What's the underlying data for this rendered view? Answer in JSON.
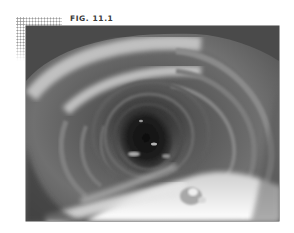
{
  "figure": {
    "caption": "FIG. 11.1",
    "image": {
      "description": "Grayscale endoscopic photograph of a tubular lumen with concentric mucosal folds",
      "colors": {
        "dark_lumen": "#1a1a1a",
        "mid_tone": "#6b6b6b",
        "highlight": "#f2f2f2",
        "frame_dots": "#9a9a9a",
        "caption_text": "#3a3a3a"
      }
    }
  }
}
